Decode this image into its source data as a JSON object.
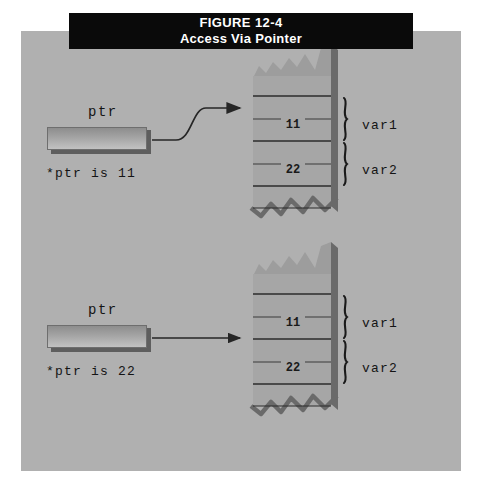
{
  "figure": {
    "number": "FIGURE 12-4",
    "title": "Access Via Pointer"
  },
  "colors": {
    "page_background": "#ffffff",
    "panel_background": "#b0b0b0",
    "titlebar_background": "#0a0a0a",
    "titlebar_text": "#ffffff",
    "ink": "#141414",
    "memory_fill": "#a3a3a3",
    "memory_shadow": "#6a6a6a",
    "box_face_light": "#c2c2c2",
    "box_face_dark": "#8d8d8d"
  },
  "diagrams": [
    {
      "id": "top",
      "pointer_label": "ptr",
      "deref_caption": "*ptr is 11",
      "arrow_style": "curved-up",
      "memory": {
        "values": [
          {
            "text": "11",
            "cell_index": 1
          },
          {
            "text": "22",
            "cell_index": 3
          }
        ],
        "brace_labels": [
          "var1",
          "var2"
        ],
        "torn_top": true,
        "torn_bottom": true,
        "cell_count": 5
      }
    },
    {
      "id": "bottom",
      "pointer_label": "ptr",
      "deref_caption": "*ptr is 22",
      "arrow_style": "straight",
      "memory": {
        "values": [
          {
            "text": "11",
            "cell_index": 1
          },
          {
            "text": "22",
            "cell_index": 3
          }
        ],
        "brace_labels": [
          "var1",
          "var2"
        ],
        "torn_top": true,
        "torn_bottom": true,
        "cell_count": 5
      }
    }
  ]
}
